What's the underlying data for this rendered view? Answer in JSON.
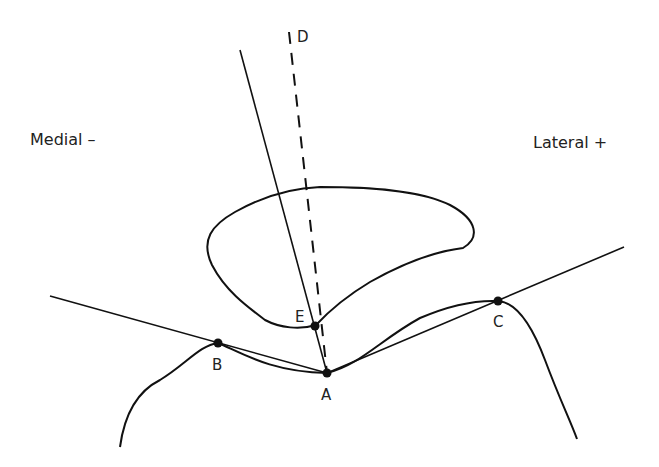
{
  "diagram": {
    "type": "anatomical line drawing",
    "labels": {
      "medial": "Medial –",
      "lateral": "Lateral +",
      "points": {
        "A": "A",
        "B": "B",
        "C": "C",
        "D": "D",
        "E": "E"
      }
    },
    "colors": {
      "stroke": "#111111",
      "text": "#222222",
      "background": "#ffffff"
    }
  }
}
